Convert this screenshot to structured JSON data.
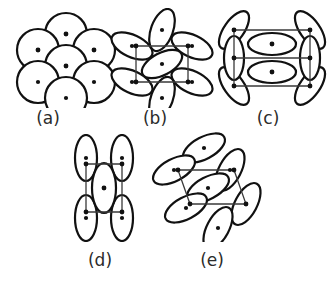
{
  "figure": {
    "background_color": "#ffffff",
    "outline_color": "#111111",
    "dot_color": "#111111",
    "lattice_dark_color": "#3a3a3a",
    "lattice_light_color": "#9a9a9a",
    "label_color": "#2b2b2b",
    "width": 333,
    "height": 286,
    "panel_count": 5,
    "rows": [
      {
        "panels": [
          "a",
          "b",
          "c"
        ]
      },
      {
        "panels": [
          "d",
          "e"
        ]
      }
    ]
  },
  "panels": [
    {
      "id": "a",
      "label": "(a)",
      "label_x": 48,
      "label_y": 108,
      "shape_type": "circle",
      "shape_count": 7,
      "lattice_type": "rhombus",
      "lattice_style": "light",
      "description": "Hexagonal close packing of seven circles with a rhombic unit cell",
      "origin_x": 14,
      "origin_y": 8,
      "view_w": 104,
      "view_h": 100,
      "shapes": [
        {
          "cx": 52,
          "cy": 26,
          "rx": 21,
          "ry": 21,
          "rot": 0
        },
        {
          "cx": 24,
          "cy": 42,
          "rx": 21,
          "ry": 21,
          "rot": 0
        },
        {
          "cx": 80,
          "cy": 42,
          "rx": 21,
          "ry": 21,
          "rot": 0
        },
        {
          "cx": 52,
          "cy": 58,
          "rx": 21,
          "ry": 21,
          "rot": 0
        },
        {
          "cx": 24,
          "cy": 74,
          "rx": 21,
          "ry": 21,
          "rot": 0
        },
        {
          "cx": 80,
          "cy": 74,
          "rx": 21,
          "ry": 21,
          "rot": 0
        },
        {
          "cx": 52,
          "cy": 90,
          "rx": 21,
          "ry": 21,
          "rot": 0
        }
      ],
      "lattice_points": [
        {
          "x": 52,
          "y": 26
        },
        {
          "x": 24,
          "y": 42
        },
        {
          "x": 80,
          "y": 42
        },
        {
          "x": 52,
          "y": 58
        }
      ],
      "lattice_path": "M 52 26 L 80 42 L 52 58 L 24 42 Z"
    },
    {
      "id": "b",
      "label": "(b)",
      "label_x": 155,
      "label_y": 108,
      "shape_type": "ellipse",
      "shape_count": 7,
      "lattice_type": "square",
      "lattice_style": "dark",
      "description": "Seven tilted ellipses packed on a square unit cell",
      "origin_x": 110,
      "origin_y": 8,
      "view_w": 104,
      "view_h": 100,
      "shapes": [
        {
          "cx": 52,
          "cy": 22,
          "rx": 11,
          "ry": 22,
          "rot": 20
        },
        {
          "cx": 22,
          "cy": 38,
          "rx": 11,
          "ry": 22,
          "rot": 115
        },
        {
          "cx": 82,
          "cy": 38,
          "rx": 11,
          "ry": 22,
          "rot": 115
        },
        {
          "cx": 52,
          "cy": 56,
          "rx": 11,
          "ry": 22,
          "rot": 62
        },
        {
          "cx": 22,
          "cy": 74,
          "rx": 11,
          "ry": 22,
          "rot": 115
        },
        {
          "cx": 82,
          "cy": 74,
          "rx": 11,
          "ry": 22,
          "rot": 115
        },
        {
          "cx": 52,
          "cy": 90,
          "rx": 11,
          "ry": 22,
          "rot": 20
        }
      ],
      "lattice_points": [
        {
          "x": 26,
          "y": 38
        },
        {
          "x": 78,
          "y": 38
        },
        {
          "x": 78,
          "y": 74
        },
        {
          "x": 26,
          "y": 74
        }
      ],
      "lattice_path": "M 26 38 L 78 38 L 78 74 L 26 74 Z"
    },
    {
      "id": "c",
      "label": "(c)",
      "label_x": 268,
      "label_y": 108,
      "shape_type": "ellipse",
      "shape_count": 8,
      "lattice_type": "rectangle",
      "lattice_style": "dark",
      "description": "Eight ellipses on a rectangular unit cell with two horizontal interior ellipses",
      "origin_x": 214,
      "origin_y": 8,
      "view_w": 116,
      "view_h": 100,
      "shapes": [
        {
          "cx": 20,
          "cy": 22,
          "rx": 10,
          "ry": 22,
          "rot": 35
        },
        {
          "cx": 96,
          "cy": 22,
          "rx": 10,
          "ry": 22,
          "rot": 145
        },
        {
          "cx": 20,
          "cy": 78,
          "rx": 10,
          "ry": 22,
          "rot": 145
        },
        {
          "cx": 96,
          "cy": 78,
          "rx": 10,
          "ry": 22,
          "rot": 35
        },
        {
          "cx": 20,
          "cy": 50,
          "rx": 10,
          "ry": 22,
          "rot": 0
        },
        {
          "cx": 96,
          "cy": 50,
          "rx": 10,
          "ry": 22,
          "rot": 0
        },
        {
          "cx": 58,
          "cy": 36,
          "rx": 24,
          "ry": 11,
          "rot": 0
        },
        {
          "cx": 58,
          "cy": 64,
          "rx": 24,
          "ry": 11,
          "rot": 0
        }
      ],
      "lattice_points": [
        {
          "x": 20,
          "y": 22
        },
        {
          "x": 96,
          "y": 22
        },
        {
          "x": 96,
          "y": 50
        },
        {
          "x": 20,
          "y": 50
        },
        {
          "x": 20,
          "y": 78
        },
        {
          "x": 96,
          "y": 78
        },
        {
          "x": 58,
          "y": 36
        },
        {
          "x": 58,
          "y": 64
        }
      ],
      "lattice_path": "M 20 22 L 96 22 L 96 78 L 20 78 Z M 20 50 L 96 50"
    },
    {
      "id": "d",
      "label": "(d)",
      "label_x": 100,
      "label_y": 250,
      "shape_type": "ellipse",
      "shape_count": 5,
      "lattice_type": "rectangle",
      "lattice_style": "dark",
      "description": "Five vertically aligned ellipses on a rectangular unit cell with a centred ellipse",
      "origin_x": 64,
      "origin_y": 134,
      "view_w": 80,
      "view_h": 108,
      "shapes": [
        {
          "cx": 22,
          "cy": 24,
          "rx": 11,
          "ry": 23,
          "rot": 0
        },
        {
          "cx": 58,
          "cy": 24,
          "rx": 11,
          "ry": 23,
          "rot": 0
        },
        {
          "cx": 22,
          "cy": 84,
          "rx": 11,
          "ry": 23,
          "rot": 0
        },
        {
          "cx": 58,
          "cy": 84,
          "rx": 11,
          "ry": 23,
          "rot": 0
        },
        {
          "cx": 40,
          "cy": 54,
          "rx": 12,
          "ry": 25,
          "rot": 0
        }
      ],
      "lattice_points": [
        {
          "x": 22,
          "y": 30
        },
        {
          "x": 58,
          "y": 30
        },
        {
          "x": 58,
          "y": 78
        },
        {
          "x": 22,
          "y": 78
        },
        {
          "x": 40,
          "y": 54
        }
      ],
      "lattice_path": "M 22 30 L 58 30 L 58 78 L 22 78 Z"
    },
    {
      "id": "e",
      "label": "(e)",
      "label_x": 212,
      "label_y": 250,
      "shape_type": "ellipse",
      "shape_count": 7,
      "lattice_type": "parallelogram",
      "lattice_style": "dark",
      "description": "Seven tilted ellipses on an oblique parallelogram unit cell",
      "origin_x": 150,
      "origin_y": 128,
      "view_w": 116,
      "view_h": 114,
      "shapes": [
        {
          "cx": 54,
          "cy": 20,
          "rx": 11,
          "ry": 23,
          "rot": 62
        },
        {
          "cx": 24,
          "cy": 42,
          "rx": 11,
          "ry": 23,
          "rot": 62
        },
        {
          "cx": 80,
          "cy": 42,
          "rx": 11,
          "ry": 23,
          "rot": 28
        },
        {
          "cx": 58,
          "cy": 60,
          "rx": 11,
          "ry": 23,
          "rot": 62
        },
        {
          "cx": 36,
          "cy": 80,
          "rx": 11,
          "ry": 23,
          "rot": 62
        },
        {
          "cx": 96,
          "cy": 76,
          "rx": 11,
          "ry": 23,
          "rot": 28
        },
        {
          "cx": 68,
          "cy": 100,
          "rx": 11,
          "ry": 23,
          "rot": 28
        }
      ],
      "lattice_points": [
        {
          "x": 28,
          "y": 42
        },
        {
          "x": 84,
          "y": 42
        },
        {
          "x": 96,
          "y": 76
        },
        {
          "x": 40,
          "y": 76
        }
      ],
      "lattice_path": "M 28 42 L 84 42 L 96 76 L 40 76 Z"
    }
  ]
}
